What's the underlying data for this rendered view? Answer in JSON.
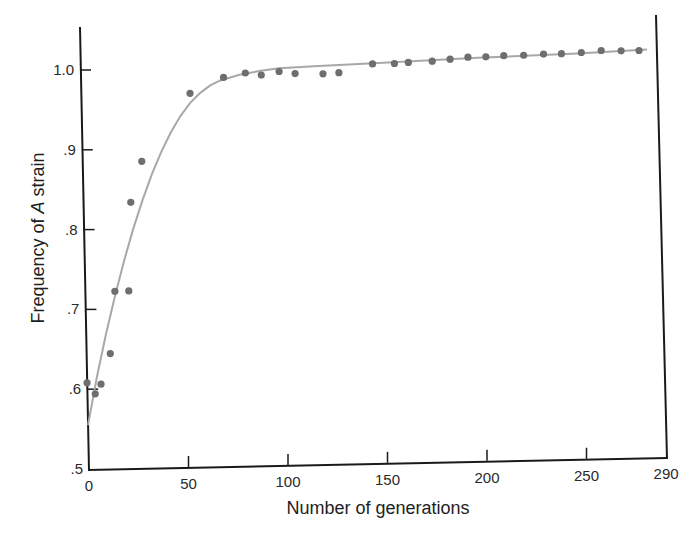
{
  "chart_data": {
    "type": "scatter",
    "title": "",
    "xlabel": "Number of generations",
    "ylabel_prefix": "Frequency of ",
    "ylabel_italic": "A",
    "ylabel_suffix": " strain",
    "xlim": [
      0,
      290
    ],
    "ylim": [
      0.5,
      1.05
    ],
    "x_ticks": [
      0,
      50,
      100,
      150,
      200,
      250,
      290
    ],
    "x_tick_labels": [
      "0",
      "50",
      "100",
      "150",
      "200",
      "250",
      "290"
    ],
    "y_ticks": [
      0.5,
      0.6,
      0.7,
      0.8,
      0.9,
      1.0
    ],
    "y_tick_labels": [
      ".5",
      ".6",
      ".7",
      ".8",
      ".9",
      "1.0"
    ],
    "grid": false,
    "legend": null,
    "series": [
      {
        "name": "observed",
        "kind": "scatter",
        "color": "#6e6e6e",
        "points": [
          [
            0,
            0.608
          ],
          [
            4,
            0.594
          ],
          [
            7,
            0.606
          ],
          [
            12,
            0.644
          ],
          [
            15,
            0.722
          ],
          [
            22,
            0.722
          ],
          [
            24,
            0.833
          ],
          [
            30,
            0.884
          ],
          [
            55,
            0.968
          ],
          [
            72,
            0.987
          ],
          [
            83,
            0.992
          ],
          [
            91,
            0.989
          ],
          [
            100,
            0.993
          ],
          [
            108,
            0.99
          ],
          [
            122,
            0.989
          ],
          [
            130,
            0.99
          ],
          [
            147,
            1.0
          ],
          [
            158,
            1.0
          ],
          [
            165,
            1.001
          ],
          [
            177,
            1.002
          ],
          [
            186,
            1.004
          ],
          [
            195,
            1.006
          ],
          [
            204,
            1.006
          ],
          [
            213,
            1.007
          ],
          [
            223,
            1.007
          ],
          [
            233,
            1.008
          ],
          [
            242,
            1.008
          ],
          [
            252,
            1.009
          ],
          [
            262,
            1.011
          ],
          [
            272,
            1.01
          ],
          [
            281,
            1.01
          ]
        ]
      },
      {
        "name": "fitted curve",
        "kind": "line",
        "color": "#a8a8a8",
        "points": [
          [
            0,
            0.555
          ],
          [
            5,
            0.615
          ],
          [
            10,
            0.668
          ],
          [
            15,
            0.716
          ],
          [
            20,
            0.76
          ],
          [
            25,
            0.8
          ],
          [
            30,
            0.836
          ],
          [
            35,
            0.868
          ],
          [
            40,
            0.896
          ],
          [
            45,
            0.92
          ],
          [
            50,
            0.94
          ],
          [
            55,
            0.956
          ],
          [
            60,
            0.968
          ],
          [
            65,
            0.977
          ],
          [
            70,
            0.983
          ],
          [
            80,
            0.99
          ],
          [
            90,
            0.994
          ],
          [
            100,
            0.997
          ],
          [
            120,
            0.999
          ],
          [
            150,
            1.001
          ],
          [
            200,
            1.005
          ],
          [
            250,
            1.008
          ],
          [
            285,
            1.011
          ]
        ]
      }
    ]
  }
}
